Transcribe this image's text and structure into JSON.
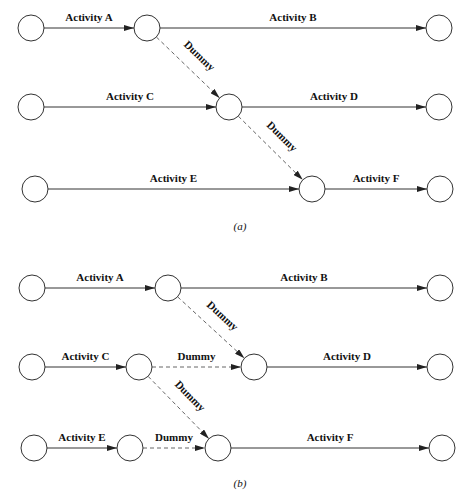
{
  "diagram_a": {
    "caption": "(a)",
    "nodes": [
      {
        "id": "a1",
        "x": 31,
        "y": 28
      },
      {
        "id": "a2",
        "x": 147,
        "y": 28
      },
      {
        "id": "a3",
        "x": 439,
        "y": 28
      },
      {
        "id": "a4",
        "x": 31,
        "y": 107
      },
      {
        "id": "a5",
        "x": 229,
        "y": 107
      },
      {
        "id": "a6",
        "x": 439,
        "y": 107
      },
      {
        "id": "a7",
        "x": 35,
        "y": 189
      },
      {
        "id": "a8",
        "x": 312,
        "y": 189
      },
      {
        "id": "a9",
        "x": 440,
        "y": 189
      }
    ],
    "edges": [
      {
        "from": "a1",
        "to": "a2",
        "label": "Activity A",
        "type": "activity"
      },
      {
        "from": "a2",
        "to": "a3",
        "label": "Activity B",
        "type": "activity"
      },
      {
        "from": "a2",
        "to": "a5",
        "label": "Dummy",
        "type": "dummy"
      },
      {
        "from": "a4",
        "to": "a5",
        "label": "Activity C",
        "type": "activity"
      },
      {
        "from": "a5",
        "to": "a6",
        "label": "Activity D",
        "type": "activity"
      },
      {
        "from": "a5",
        "to": "a8",
        "label": "Dummy",
        "type": "dummy"
      },
      {
        "from": "a7",
        "to": "a8",
        "label": "Activity E",
        "type": "activity"
      },
      {
        "from": "a8",
        "to": "a9",
        "label": "Activity F",
        "type": "activity"
      }
    ]
  },
  "diagram_b": {
    "caption": "(b)",
    "nodes": [
      {
        "id": "b1",
        "x": 32,
        "y": 288
      },
      {
        "id": "b2",
        "x": 168,
        "y": 288
      },
      {
        "id": "b3",
        "x": 440,
        "y": 288
      },
      {
        "id": "b4",
        "x": 32,
        "y": 367
      },
      {
        "id": "b5",
        "x": 139,
        "y": 367
      },
      {
        "id": "b6",
        "x": 254,
        "y": 367
      },
      {
        "id": "b7",
        "x": 440,
        "y": 367
      },
      {
        "id": "b8",
        "x": 34,
        "y": 448
      },
      {
        "id": "b9",
        "x": 130,
        "y": 448
      },
      {
        "id": "b10",
        "x": 218,
        "y": 448
      },
      {
        "id": "b11",
        "x": 442,
        "y": 448
      }
    ],
    "edges": [
      {
        "from": "b1",
        "to": "b2",
        "label": "Activity A",
        "type": "activity"
      },
      {
        "from": "b2",
        "to": "b3",
        "label": "Activity B",
        "type": "activity"
      },
      {
        "from": "b2",
        "to": "b6",
        "label": "Dummy",
        "type": "dummy"
      },
      {
        "from": "b4",
        "to": "b5",
        "label": "Activity C",
        "type": "activity"
      },
      {
        "from": "b5",
        "to": "b6",
        "label": "Dummy",
        "type": "dummy"
      },
      {
        "from": "b6",
        "to": "b7",
        "label": "Activity D",
        "type": "activity"
      },
      {
        "from": "b5",
        "to": "b10",
        "label": "Dummy",
        "type": "dummy"
      },
      {
        "from": "b8",
        "to": "b9",
        "label": "Activity E",
        "type": "activity"
      },
      {
        "from": "b9",
        "to": "b10",
        "label": "Dummy",
        "type": "dummy"
      },
      {
        "from": "b10",
        "to": "b11",
        "label": "Activity F",
        "type": "activity"
      }
    ]
  },
  "captions": {
    "a": "(a)",
    "b": "(b)"
  }
}
